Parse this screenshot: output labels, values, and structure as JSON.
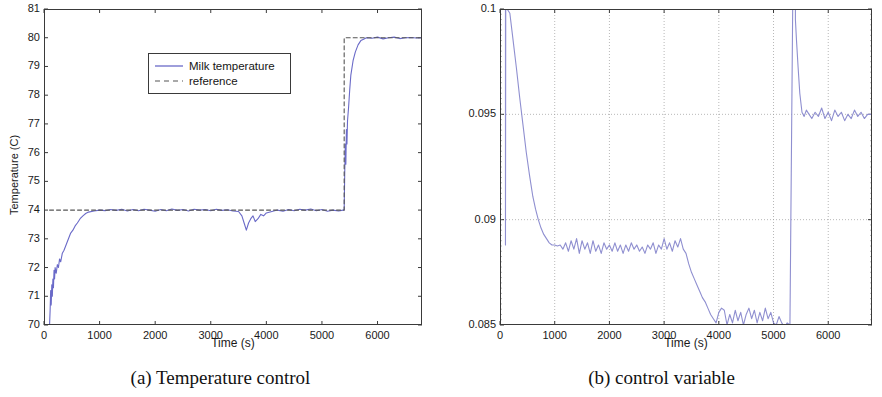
{
  "figure": {
    "panel_a": {
      "caption": "(a) Temperature control",
      "xlabel": "Time (s)",
      "ylabel": "Temperature (C)",
      "legend": {
        "entries": [
          {
            "label": "Milk temperature",
            "style": "solid",
            "color": "#6a6ac8"
          },
          {
            "label": "reference",
            "style": "dashed",
            "color": "#555555"
          }
        ]
      }
    },
    "panel_b": {
      "caption": "(b) control variable",
      "xlabel": "Time (s)",
      "ylabel": "Flow (m3/s)"
    }
  },
  "chart_data": [
    {
      "type": "line",
      "id": "temperature-control",
      "title": "(a) Temperature control",
      "xlabel": "Time (s)",
      "ylabel": "Temperature (C)",
      "xlim": [
        0,
        6800
      ],
      "ylim": [
        70,
        81
      ],
      "xticks": [
        0,
        1000,
        2000,
        3000,
        4000,
        5000,
        6000
      ],
      "yticks": [
        70,
        71,
        72,
        73,
        74,
        75,
        76,
        77,
        78,
        79,
        80,
        81
      ],
      "grid": false,
      "legend_position": "upper-center",
      "series": [
        {
          "name": "Milk temperature",
          "style": "solid",
          "color": "#6a6ac8",
          "x": [
            100,
            110,
            120,
            130,
            140,
            150,
            160,
            170,
            180,
            190,
            200,
            220,
            240,
            260,
            280,
            300,
            330,
            360,
            400,
            440,
            480,
            520,
            560,
            600,
            650,
            700,
            750,
            800,
            900,
            1000,
            1100,
            1200,
            1300,
            1400,
            1500,
            1600,
            1700,
            1800,
            1900,
            2000,
            2100,
            2200,
            2300,
            2400,
            2500,
            2600,
            2700,
            2800,
            2900,
            3000,
            3100,
            3200,
            3300,
            3400,
            3500,
            3560,
            3600,
            3640,
            3680,
            3720,
            3760,
            3800,
            3850,
            3900,
            3950,
            4000,
            4100,
            4200,
            4300,
            4400,
            4500,
            4600,
            4700,
            4800,
            4900,
            5000,
            5100,
            5200,
            5300,
            5380,
            5400,
            5410,
            5420,
            5430,
            5440,
            5450,
            5460,
            5480,
            5500,
            5520,
            5560,
            5600,
            5650,
            5700,
            5750,
            5800,
            5900,
            6000,
            6100,
            6200,
            6300,
            6400,
            6500,
            6600,
            6700,
            6800
          ],
          "y": [
            70.0,
            70.5,
            71.2,
            70.7,
            71.4,
            71.0,
            71.6,
            71.3,
            71.9,
            71.6,
            72.0,
            71.8,
            72.1,
            72.0,
            72.3,
            72.2,
            72.5,
            72.6,
            72.8,
            73.0,
            73.2,
            73.3,
            73.45,
            73.55,
            73.7,
            73.8,
            73.88,
            73.93,
            73.97,
            74.0,
            73.98,
            74.02,
            73.99,
            74.03,
            73.97,
            74.02,
            73.98,
            74.03,
            74.0,
            73.96,
            74.02,
            73.98,
            74.04,
            73.99,
            74.02,
            73.97,
            74.03,
            74.0,
            74.02,
            73.98,
            74.03,
            73.99,
            74.01,
            73.97,
            73.95,
            73.8,
            73.55,
            73.3,
            73.55,
            73.7,
            73.8,
            73.6,
            73.7,
            73.85,
            73.8,
            73.9,
            73.95,
            74.0,
            73.96,
            74.02,
            73.98,
            74.03,
            74.0,
            74.04,
            73.98,
            74.02,
            73.96,
            74.0,
            73.97,
            74.0,
            74.0,
            75.3,
            76.3,
            75.6,
            76.8,
            76.3,
            77.1,
            77.6,
            78.2,
            78.7,
            79.2,
            79.5,
            79.75,
            79.9,
            79.95,
            80.0,
            79.98,
            80.02,
            79.96,
            80.0,
            80.02,
            79.97,
            80.0,
            80.01,
            79.99,
            80.0,
            80.0
          ]
        },
        {
          "name": "reference",
          "style": "dashed",
          "color": "#555555",
          "x": [
            100,
            5400,
            5400,
            6800
          ],
          "y": [
            74,
            74,
            80,
            80
          ]
        }
      ]
    },
    {
      "type": "line",
      "id": "control-variable",
      "title": "(b) control variable",
      "xlabel": "Time (s)",
      "ylabel": "Flow (m3/s)",
      "xlim": [
        0,
        6800
      ],
      "ylim": [
        0.085,
        0.1
      ],
      "xticks": [
        0,
        1000,
        2000,
        3000,
        4000,
        5000,
        6000
      ],
      "yticks": [
        0.085,
        0.09,
        0.095,
        0.1
      ],
      "grid": true,
      "series": [
        {
          "name": "Flow",
          "style": "solid",
          "color": "#8f8fd0",
          "x": [
            100,
            100,
            105,
            130,
            180,
            240,
            300,
            360,
            420,
            480,
            540,
            600,
            650,
            700,
            750,
            800,
            850,
            900,
            950,
            1000,
            1050,
            1100,
            1150,
            1200,
            1250,
            1300,
            1350,
            1400,
            1450,
            1500,
            1550,
            1600,
            1650,
            1700,
            1750,
            1800,
            1850,
            1900,
            1950,
            2000,
            2050,
            2100,
            2150,
            2200,
            2250,
            2300,
            2350,
            2400,
            2450,
            2500,
            2550,
            2600,
            2650,
            2700,
            2750,
            2800,
            2850,
            2900,
            2950,
            3000,
            3050,
            3100,
            3150,
            3200,
            3250,
            3300,
            3350,
            3400,
            3450,
            3500,
            3550,
            3600,
            3650,
            3700,
            3750,
            3800,
            3850,
            3900,
            3950,
            4000,
            4050,
            4100,
            4150,
            4200,
            4250,
            4300,
            4350,
            4400,
            4450,
            4500,
            4550,
            4600,
            4650,
            4700,
            4750,
            4800,
            4850,
            4900,
            4950,
            5000,
            5050,
            5100,
            5150,
            5200,
            5250,
            5300,
            5350,
            5400,
            5400,
            5420,
            5450,
            5480,
            5520,
            5560,
            5600,
            5650,
            5700,
            5760,
            5820,
            5880,
            5940,
            6000,
            6060,
            6120,
            6180,
            6240,
            6300,
            6360,
            6420,
            6480,
            6540,
            6600,
            6660,
            6720,
            6800
          ],
          "y": [
            0.1,
            0.0888,
            0.1,
            0.1,
            0.0998,
            0.0985,
            0.0972,
            0.0958,
            0.0945,
            0.0932,
            0.0921,
            0.0911,
            0.0905,
            0.09,
            0.0896,
            0.0893,
            0.0891,
            0.0889,
            0.0888,
            0.0888,
            0.08875,
            0.0888,
            0.0886,
            0.0889,
            0.0885,
            0.089,
            0.0886,
            0.0891,
            0.0884,
            0.089,
            0.0886,
            0.0889,
            0.0884,
            0.089,
            0.0885,
            0.0888,
            0.0884,
            0.0889,
            0.0886,
            0.0888,
            0.0885,
            0.0889,
            0.0885,
            0.0888,
            0.0884,
            0.0888,
            0.0885,
            0.0889,
            0.0886,
            0.0888,
            0.0885,
            0.0887,
            0.0884,
            0.0888,
            0.0886,
            0.0889,
            0.0884,
            0.0888,
            0.0886,
            0.0891,
            0.0886,
            0.0889,
            0.0885,
            0.089,
            0.0887,
            0.0891,
            0.0886,
            0.0884,
            0.0879,
            0.0875,
            0.0872,
            0.0869,
            0.0866,
            0.0863,
            0.0861,
            0.0858,
            0.0855,
            0.0853,
            0.0851,
            0.0856,
            0.0858,
            0.0857,
            0.085,
            0.0855,
            0.0851,
            0.0857,
            0.0852,
            0.0856,
            0.085,
            0.0855,
            0.0858,
            0.0853,
            0.0857,
            0.0851,
            0.0856,
            0.0852,
            0.0858,
            0.0853,
            0.0856,
            0.0851,
            0.085,
            0.0854,
            0.0851,
            0.0849,
            0.0851,
            0.085,
            0.1,
            0.1,
            0.0995,
            0.0985,
            0.0972,
            0.096,
            0.0951,
            0.0949,
            0.0952,
            0.095,
            0.0948,
            0.0951,
            0.0949,
            0.0953,
            0.0948,
            0.0951,
            0.0947,
            0.0952,
            0.0949,
            0.0951,
            0.0947,
            0.095,
            0.0948,
            0.0952,
            0.0949,
            0.0951,
            0.0948,
            0.095,
            0.095
          ]
        }
      ]
    }
  ]
}
